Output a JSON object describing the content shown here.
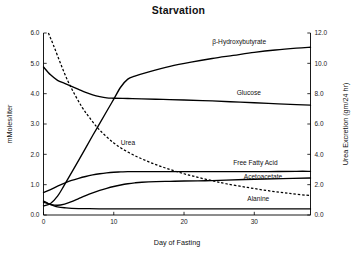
{
  "chart_data": {
    "type": "line",
    "title": "Starvation",
    "xlabel": "Day of Fasting",
    "ylabel": "mMoles/liter",
    "ylabel_right": "Urea Excretion (gm/24 hr)",
    "xlim": [
      0,
      38
    ],
    "ylim": [
      0.0,
      6.0
    ],
    "ylim_right": [
      0.0,
      12.0
    ],
    "grid": false,
    "legend_position": "inline-right-of-curves",
    "xticks": [
      "0",
      "10",
      "20",
      "30"
    ],
    "xtick_values": [
      0,
      10,
      20,
      30
    ],
    "yticks": [
      "0.0",
      "1.0",
      "2.0",
      "3.0",
      "4.0",
      "5.0",
      "6.0"
    ],
    "ytick_values": [
      0.0,
      1.0,
      2.0,
      3.0,
      4.0,
      5.0,
      6.0
    ],
    "yticks_right": [
      "0.0",
      "2.0",
      "4.0",
      "6.0",
      "8.0",
      "10.0",
      "12.0"
    ],
    "ytick_values_right": [
      0.0,
      2.0,
      4.0,
      6.0,
      8.0,
      10.0,
      12.0
    ],
    "series": [
      {
        "name": "β-Hydroxybutyrate",
        "axis": "left",
        "style": "solid",
        "label_x": 24.0,
        "label_y": 5.62,
        "x": [
          0,
          1,
          2,
          3,
          5,
          7,
          9,
          10,
          11,
          12,
          13,
          15,
          18,
          21,
          24,
          27,
          30,
          33,
          36,
          38
        ],
        "y": [
          0.3,
          0.38,
          0.62,
          1.0,
          1.8,
          2.62,
          3.42,
          3.82,
          4.22,
          4.48,
          4.58,
          4.72,
          4.9,
          5.04,
          5.16,
          5.26,
          5.36,
          5.44,
          5.5,
          5.53
        ]
      },
      {
        "name": "Glucose",
        "axis": "left",
        "style": "solid",
        "label_x": 27.5,
        "label_y": 3.92,
        "x": [
          0,
          1,
          2,
          3,
          4,
          5,
          6,
          7,
          8,
          9,
          10,
          12,
          14,
          17,
          20,
          24,
          28,
          32,
          36,
          38
        ],
        "y": [
          4.88,
          4.62,
          4.44,
          4.34,
          4.24,
          4.14,
          4.04,
          3.96,
          3.9,
          3.86,
          3.85,
          3.84,
          3.83,
          3.81,
          3.79,
          3.76,
          3.72,
          3.68,
          3.64,
          3.62
        ]
      },
      {
        "name": "Urea",
        "axis": "right",
        "style": "dashed",
        "label_x": 11.0,
        "label_y": 2.28,
        "x": [
          0.7,
          1.5,
          2.5,
          3.5,
          4.5,
          5.5,
          6.5,
          8,
          10,
          12,
          14,
          16,
          18,
          20,
          22,
          24,
          26,
          29,
          32,
          35,
          38
        ],
        "y": [
          12.0,
          11.1,
          9.9,
          8.8,
          7.9,
          7.1,
          6.45,
          5.6,
          4.75,
          4.15,
          3.7,
          3.32,
          3.0,
          2.72,
          2.48,
          2.26,
          2.06,
          1.82,
          1.6,
          1.42,
          1.28
        ]
      },
      {
        "name": "Free Fatty Acid",
        "axis": "left",
        "style": "solid",
        "label_x": 27.0,
        "label_y": 1.62,
        "x": [
          0,
          1,
          2,
          3,
          4,
          5,
          6,
          7,
          8,
          9,
          10,
          11,
          12,
          14,
          17,
          20,
          24,
          28,
          32,
          36,
          38
        ],
        "y": [
          0.74,
          0.84,
          0.95,
          1.05,
          1.14,
          1.21,
          1.27,
          1.32,
          1.36,
          1.39,
          1.41,
          1.42,
          1.43,
          1.43,
          1.43,
          1.43,
          1.43,
          1.43,
          1.43,
          1.44,
          1.44
        ]
      },
      {
        "name": "Acetoacetate",
        "axis": "left",
        "style": "solid",
        "label_x": 28.5,
        "label_y": 1.17,
        "x": [
          0,
          1,
          2,
          3,
          4,
          5,
          6,
          7,
          8,
          9,
          10,
          11,
          12,
          13,
          14,
          16,
          18,
          20,
          23,
          26,
          30,
          34,
          38
        ],
        "y": [
          0.42,
          0.35,
          0.32,
          0.36,
          0.44,
          0.54,
          0.64,
          0.73,
          0.81,
          0.88,
          0.94,
          0.99,
          1.03,
          1.06,
          1.08,
          1.1,
          1.11,
          1.12,
          1.13,
          1.15,
          1.18,
          1.2,
          1.22
        ]
      },
      {
        "name": "Alanine",
        "axis": "left",
        "style": "solid",
        "label_x": 29.0,
        "label_y": 0.44,
        "x": [
          0,
          0.5,
          1,
          1.5,
          2,
          3,
          4,
          6,
          9,
          13,
          18,
          24,
          30,
          36,
          38
        ],
        "y": [
          0.46,
          0.4,
          0.34,
          0.3,
          0.27,
          0.24,
          0.22,
          0.21,
          0.2,
          0.2,
          0.2,
          0.2,
          0.2,
          0.2,
          0.2
        ]
      }
    ]
  }
}
